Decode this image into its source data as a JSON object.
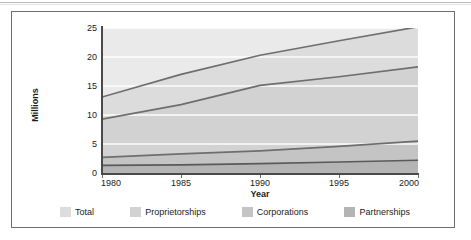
{
  "figure": {
    "y_axis_title": "Millions",
    "x_axis_title": "Year"
  },
  "legend": {
    "items": [
      {
        "label": "Total",
        "color": "#dcdcdc",
        "icon": "legend-swatch-icon"
      },
      {
        "label": "Proprietorships",
        "color": "#d2d2d2",
        "icon": "legend-swatch-icon"
      },
      {
        "label": "Corporations",
        "color": "#c4c4c4",
        "icon": "legend-swatch-icon"
      },
      {
        "label": "Partnerships",
        "color": "#b4b4b4",
        "icon": "legend-swatch-icon"
      }
    ]
  },
  "chart_data": {
    "type": "area",
    "title": "",
    "xlabel": "Year",
    "ylabel": "Millions",
    "x": [
      1980,
      1985,
      1990,
      1995,
      2000
    ],
    "xlim": [
      1980,
      2000
    ],
    "ylim": [
      0,
      25
    ],
    "ytick_labels": [
      "0",
      "5",
      "10",
      "15",
      "20",
      "25"
    ],
    "yticks": [
      0,
      5,
      10,
      15,
      20,
      25
    ],
    "xtick_labels": [
      "1980",
      "1985",
      "1990",
      "1995",
      "2000"
    ],
    "xticks": [
      1980,
      1985,
      1990,
      1995,
      2000
    ],
    "grid": "horizontal-white",
    "legend_position": "below-bottom",
    "stacked": false,
    "series": [
      {
        "name": "Total",
        "color": "#dcdcdc",
        "line_color": "#6e6e6e",
        "values": [
          13.1,
          17.0,
          20.3,
          22.8,
          25.2
        ]
      },
      {
        "name": "Proprietorships",
        "color": "#d2d2d2",
        "line_color": "#6e6e6e",
        "values": [
          9.3,
          11.8,
          15.1,
          16.6,
          18.3
        ]
      },
      {
        "name": "Corporations",
        "color": "#c4c4c4",
        "line_color": "#6e6e6e",
        "values": [
          2.7,
          3.3,
          3.8,
          4.6,
          5.5
        ]
      },
      {
        "name": "Partnerships",
        "color": "#b4b4b4",
        "line_color": "#5a5a5a",
        "values": [
          1.3,
          1.4,
          1.6,
          1.9,
          2.2
        ]
      }
    ]
  }
}
